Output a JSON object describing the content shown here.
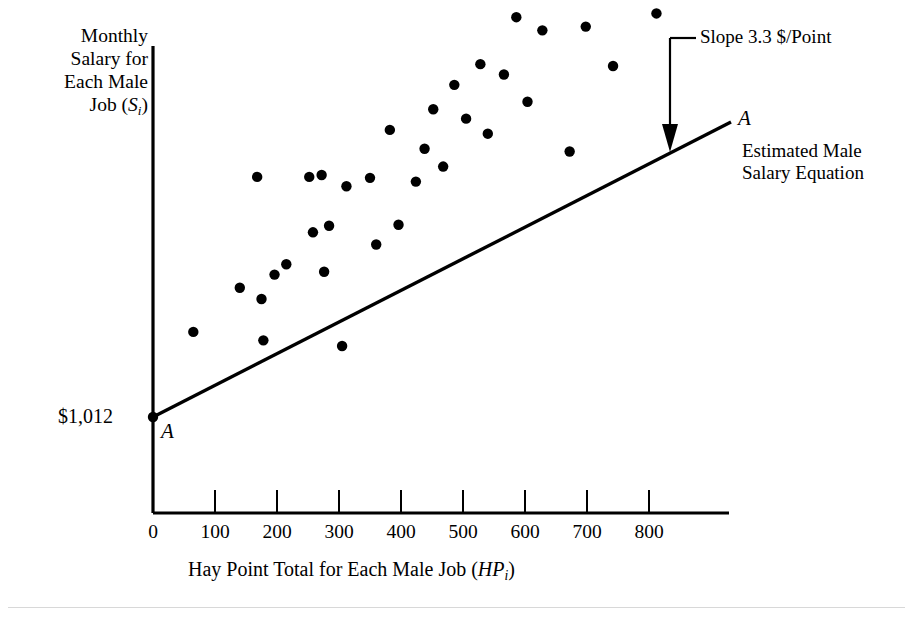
{
  "chart_data": {
    "type": "scatter",
    "title": "",
    "xlabel": "Hay Point Total for Each Male Job (HPᵢ)",
    "xlabel_main": "Hay Point Total for Each Male Job (",
    "xlabel_italic": "HP",
    "xlabel_sub": "i",
    "xlabel_tail": ")",
    "ylabel_lines": [
      "Monthly",
      "Salary for",
      "Each Male",
      "Job (S",
      "i",
      ")"
    ],
    "ylabel_main": "Monthly Salary for Each Male Job (Sᵢ)",
    "xlim": [
      0,
      930
    ],
    "ylim": [
      0,
      4000
    ],
    "xticks": [
      0,
      100,
      200,
      300,
      400,
      500,
      600,
      700,
      800
    ],
    "xtick_labels": [
      "0",
      "100",
      "200",
      "300",
      "400",
      "500",
      "600",
      "700",
      "800"
    ],
    "yticks": [],
    "ytick_labels": [
      "$1,012"
    ],
    "grid": false,
    "legend": "none",
    "intercept_label": "$1,012",
    "intercept_value": 1012,
    "slope_value": 3.3,
    "slope_units": "$/Point",
    "fit_line": {
      "label": "A",
      "name": "Estimated Male Salary Equation",
      "x_start": 0,
      "y_start": 1012,
      "x_end": 930,
      "y_end": 4081
    },
    "annotations": [
      {
        "name": "slope-callout",
        "text": "Slope 3.3 $/Point",
        "points_to_x": 830,
        "points_to_y": 3751
      },
      {
        "name": "equation-callout",
        "text": "Estimated Male Salary Equation",
        "line1": "Estimated Male",
        "line2": "Salary Equation"
      },
      {
        "name": "line-endpoint-right",
        "text": "A"
      },
      {
        "name": "line-endpoint-left",
        "text": "A"
      }
    ],
    "points": [
      {
        "x": 0,
        "y": 1012
      },
      {
        "x": 65,
        "y": 1465
      },
      {
        "x": 140,
        "y": 1700
      },
      {
        "x": 168,
        "y": 2290
      },
      {
        "x": 175,
        "y": 1640
      },
      {
        "x": 178,
        "y": 1420
      },
      {
        "x": 196,
        "y": 1770
      },
      {
        "x": 215,
        "y": 1825
      },
      {
        "x": 252,
        "y": 2290
      },
      {
        "x": 258,
        "y": 1995
      },
      {
        "x": 272,
        "y": 2300
      },
      {
        "x": 276,
        "y": 1785
      },
      {
        "x": 284,
        "y": 2030
      },
      {
        "x": 305,
        "y": 1390
      },
      {
        "x": 312,
        "y": 2240
      },
      {
        "x": 350,
        "y": 2285
      },
      {
        "x": 360,
        "y": 1930
      },
      {
        "x": 382,
        "y": 2540
      },
      {
        "x": 396,
        "y": 2035
      },
      {
        "x": 424,
        "y": 2265
      },
      {
        "x": 438,
        "y": 2440
      },
      {
        "x": 452,
        "y": 2650
      },
      {
        "x": 468,
        "y": 2345
      },
      {
        "x": 486,
        "y": 2780
      },
      {
        "x": 505,
        "y": 2600
      },
      {
        "x": 528,
        "y": 2890
      },
      {
        "x": 540,
        "y": 2520
      },
      {
        "x": 566,
        "y": 2835
      },
      {
        "x": 586,
        "y": 3140
      },
      {
        "x": 604,
        "y": 2690
      },
      {
        "x": 628,
        "y": 3070
      },
      {
        "x": 648,
        "y": 3300
      },
      {
        "x": 672,
        "y": 2425
      },
      {
        "x": 698,
        "y": 3090
      },
      {
        "x": 722,
        "y": 3275
      },
      {
        "x": 742,
        "y": 2880
      },
      {
        "x": 768,
        "y": 3455
      },
      {
        "x": 780,
        "y": 3290
      },
      {
        "x": 798,
        "y": 3620
      },
      {
        "x": 806,
        "y": 3340
      },
      {
        "x": 812,
        "y": 3160
      }
    ]
  },
  "axis": {
    "x_axis_name": "x-axis",
    "y_axis_name": "y-axis"
  }
}
